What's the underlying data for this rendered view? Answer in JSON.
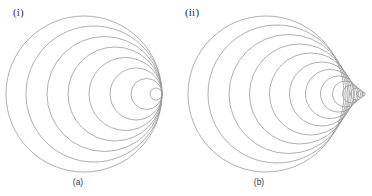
{
  "figure": {
    "background_color": "#ffffff",
    "stroke_color": "#9a9a9a",
    "stroke_width": 0.8,
    "width": 372,
    "height": 196
  },
  "panels": [
    {
      "id": "panel-left",
      "roman_label": "(i)",
      "caption": "(a)",
      "description": "Source moving at the wave speed: all wavefronts are tangent at a single point",
      "mach_regime": "sonic",
      "convergence_point": {
        "x": 162,
        "y": 94
      },
      "circles": [
        {
          "cx": 84.0,
          "cy": 94,
          "r": 78.0
        },
        {
          "cx": 94.0,
          "cy": 94,
          "r": 68.0
        },
        {
          "cx": 104.5,
          "cy": 94,
          "r": 57.5
        },
        {
          "cx": 115.0,
          "cy": 94,
          "r": 47.0
        },
        {
          "cx": 125.5,
          "cy": 94,
          "r": 36.5
        },
        {
          "cx": 136.0,
          "cy": 94,
          "r": 26.0
        },
        {
          "cx": 146.5,
          "cy": 94,
          "r": 15.5
        },
        {
          "cx": 156.0,
          "cy": 94,
          "r": 6.0
        }
      ]
    },
    {
      "id": "panel-right",
      "roman_label": "(ii)",
      "caption": "(b)",
      "description": "Source moving faster than the wave speed: wavefronts form a V-shaped Mach cone",
      "mach_regime": "supersonic",
      "cone_apex": {
        "x": 366,
        "y": 94
      },
      "circles": [
        {
          "cx": 266.0,
          "cy": 94,
          "r": 78.0
        },
        {
          "cx": 277.0,
          "cy": 94,
          "r": 69.0
        },
        {
          "cx": 288.5,
          "cy": 94,
          "r": 59.5
        },
        {
          "cx": 299.5,
          "cy": 94,
          "r": 50.0
        },
        {
          "cx": 310.5,
          "cy": 94,
          "r": 41.0
        },
        {
          "cx": 321.5,
          "cy": 94,
          "r": 32.0
        },
        {
          "cx": 330.0,
          "cy": 94,
          "r": 24.5
        },
        {
          "cx": 338.5,
          "cy": 94,
          "r": 18.0
        },
        {
          "cx": 345.5,
          "cy": 94,
          "r": 13.0
        },
        {
          "cx": 351.5,
          "cy": 94,
          "r": 9.0
        },
        {
          "cx": 356.5,
          "cy": 94,
          "r": 6.0
        },
        {
          "cx": 360.5,
          "cy": 94,
          "r": 3.5
        },
        {
          "cx": 363.5,
          "cy": 94,
          "r": 1.8
        }
      ]
    }
  ]
}
